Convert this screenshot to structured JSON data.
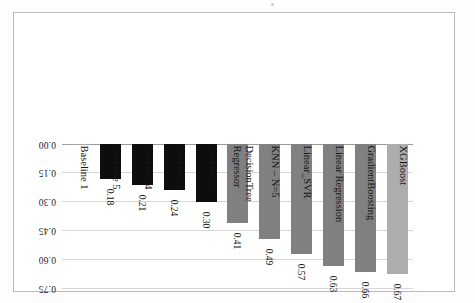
{
  "chart_data": {
    "type": "bar",
    "title": "",
    "subtitle": "",
    "xlabel": "",
    "ylabel": "",
    "orientation": "vertical",
    "rotated_180": true,
    "grid": true,
    "legend": "none",
    "ylim": [
      0.0,
      0.75
    ],
    "yticks": [
      "0.00",
      "0.15",
      "0.30",
      "0.45",
      "0.60",
      "0.75"
    ],
    "ytick_values": [
      0.0,
      0.15,
      0.3,
      0.45,
      0.6,
      0.75
    ],
    "categories": [
      "XGBoost",
      "GradientBoosting",
      "Linear Regression",
      "Linear_SVR",
      "KNN – N=5",
      "DecisionTree\nRegressor",
      "Baseline 2",
      "Baseline 3",
      "Baseline 4",
      "Baseline 5",
      "Baseline 1"
    ],
    "values": [
      0.67,
      0.66,
      0.63,
      0.57,
      0.49,
      0.41,
      0.3,
      0.24,
      0.21,
      0.18,
      0.0
    ],
    "value_labels": [
      "0.67",
      "0.66",
      "0.63",
      "0.57",
      "0.49",
      "0.41",
      "0.30",
      "0.24",
      "0.21",
      "0.18",
      ""
    ],
    "bar_colors": [
      "#adadad",
      "#808080",
      "#808080",
      "#808080",
      "#808080",
      "#808080",
      "#0d0d0d",
      "#0d0d0d",
      "#0d0d0d",
      "#0d0d0d",
      "#a5a5a5"
    ],
    "colors": {
      "light_gray": "#adadad",
      "gray": "#808080",
      "black": "#0d0d0d",
      "gridline": "#d6d6d6",
      "axis": "#9a9a9a",
      "border": "#b9b9b9"
    }
  }
}
